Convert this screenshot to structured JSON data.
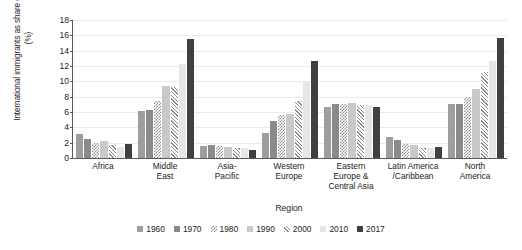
{
  "chart_data": {
    "type": "bar",
    "title": "",
    "xlabel": "Region",
    "ylabel": "International immigrants as share of population (%)",
    "ylim": [
      0,
      18
    ],
    "yticks": [
      0,
      2,
      4,
      6,
      8,
      10,
      12,
      14,
      16,
      18
    ],
    "grid": true,
    "legend_position": "bottom",
    "categories": [
      "Africa",
      "Middle East",
      "Asia-Pacific",
      "Western Europe",
      "Eastern Europe & Central Asia",
      "Latin America /Caribbean",
      "North America"
    ],
    "category_lines": [
      [
        "Africa"
      ],
      [
        "Middle",
        "East"
      ],
      [
        "Asia-",
        "Pacific"
      ],
      [
        "Western",
        "Europe"
      ],
      [
        "Eastern",
        "Europe &",
        "Central Asia"
      ],
      [
        "Latin America",
        "/Caribbean"
      ],
      [
        "North",
        "America"
      ]
    ],
    "series": [
      {
        "name": "1960",
        "color": "#9e9e9e",
        "pattern": "solid-mid",
        "values": [
          3.1,
          6.1,
          1.6,
          3.3,
          6.7,
          2.8,
          7.0
        ]
      },
      {
        "name": "1970",
        "color": "#8a8a8a",
        "pattern": "solid-dark",
        "values": [
          2.5,
          6.3,
          1.7,
          4.8,
          7.1,
          2.4,
          7.0
        ]
      },
      {
        "name": "1980",
        "color": "#8f8f8f",
        "pattern": "checker",
        "values": [
          2.0,
          7.4,
          1.6,
          5.6,
          7.1,
          1.8,
          7.9
        ]
      },
      {
        "name": "1990",
        "color": "#c9c9c9",
        "pattern": "solid-light",
        "values": [
          2.2,
          9.4,
          1.5,
          5.8,
          7.2,
          1.7,
          9.0
        ]
      },
      {
        "name": "2000",
        "color": "#8b8b8b",
        "pattern": "diagonal",
        "values": [
          1.7,
          9.3,
          1.3,
          7.4,
          6.9,
          1.3,
          11.2
        ]
      },
      {
        "name": "2010",
        "color": "#e6e6e6",
        "pattern": "solid-pale",
        "values": [
          1.4,
          12.3,
          1.3,
          9.9,
          6.9,
          1.3,
          12.7
        ]
      },
      {
        "name": "2017",
        "color": "#404040",
        "pattern": "solid-black",
        "values": [
          1.8,
          15.5,
          1.1,
          12.7,
          6.7,
          1.5,
          15.6
        ]
      }
    ]
  }
}
